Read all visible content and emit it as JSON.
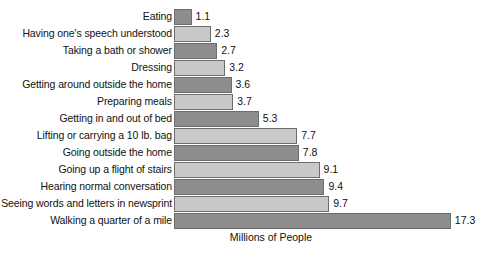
{
  "chart_data": {
    "type": "bar",
    "orientation": "horizontal",
    "title": "",
    "subtitle": "",
    "xlabel": "Millions of People",
    "ylabel": "",
    "grid": false,
    "legend": "none",
    "xlim": [
      0,
      19
    ],
    "value_unit": "millions",
    "categories": [
      "Eating",
      "Having one's speech understood",
      "Taking a bath or shower",
      "Dressing",
      "Getting around outside the home",
      "Preparing meals",
      "Getting in and out of bed",
      "Lifting or carrying a 10 lb. bag",
      "Going outside the home",
      "Going up a flight of stairs",
      "Hearing normal conversation",
      "Seeing words and letters in newsprint",
      "Walking a quarter of a mile"
    ],
    "values": [
      1.1,
      2.3,
      2.7,
      3.2,
      3.6,
      3.7,
      5.3,
      7.7,
      7.8,
      9.1,
      9.4,
      9.7,
      17.3
    ],
    "value_labels": [
      "1.1",
      "2.3",
      "2.7",
      "3.2",
      "3.6",
      "3.7",
      "5.3",
      "7.7",
      "7.8",
      "9.1",
      "9.4",
      "9.7",
      "17.3"
    ],
    "bar_shades": [
      "dark",
      "light",
      "dark",
      "light",
      "dark",
      "light",
      "dark",
      "light",
      "dark",
      "light",
      "dark",
      "light",
      "dark"
    ],
    "colors": {
      "bar_dark": "#8d8d8d",
      "bar_light": "#c9c9c9",
      "bar_border": "#6d6d6d",
      "background": "#ffffff",
      "text": "#111111"
    }
  }
}
